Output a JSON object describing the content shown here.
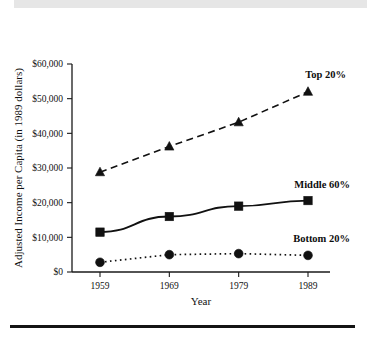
{
  "figure": {
    "header_band_color": "#e6e6e6",
    "rule_color": "#141414",
    "background": "#ffffff"
  },
  "chart_data": {
    "type": "line",
    "title": "",
    "xlabel": "Year",
    "ylabel": "Adjusted Income per Capita (in 1989 dollars)",
    "x": [
      1959,
      1969,
      1979,
      1989
    ],
    "categories": [
      "1959",
      "1969",
      "1979",
      "1989"
    ],
    "xtick_labels": [
      "1959",
      "1969",
      "1979",
      "1989"
    ],
    "ytick_labels": [
      "$0",
      "$10,000",
      "$20,000",
      "$30,000",
      "$40,000",
      "$50,000",
      "$60,000"
    ],
    "ytick_values": [
      0,
      10000,
      20000,
      30000,
      40000,
      50000,
      60000
    ],
    "ylim": [
      0,
      60000
    ],
    "xlim": [
      1955,
      1993
    ],
    "grid": false,
    "legend_position": "inline-right",
    "series": [
      {
        "name": "Top 20%",
        "label": "Top 20%",
        "values": [
          28800,
          36200,
          43200,
          52000
        ],
        "marker": "triangle",
        "line_style": "dashed",
        "color": "#111111"
      },
      {
        "name": "Middle 60%",
        "label": "Middle 60%",
        "values": [
          11500,
          16000,
          19000,
          20600
        ],
        "marker": "square",
        "line_style": "solid",
        "color": "#111111"
      },
      {
        "name": "Bottom 20%",
        "label": "Bottom 20%",
        "values": [
          2800,
          5000,
          5300,
          4800
        ],
        "marker": "circle",
        "line_style": "dotted",
        "color": "#111111"
      }
    ]
  }
}
